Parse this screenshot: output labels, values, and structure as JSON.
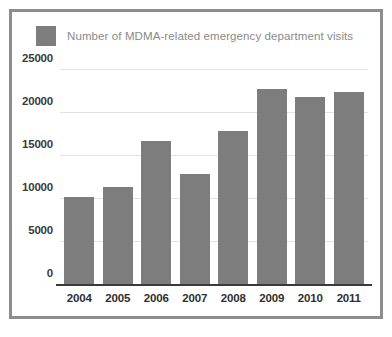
{
  "figure": {
    "border_color": "#8d8d8d",
    "background": "#ffffff"
  },
  "legend": {
    "swatch_icon": "legend-swatch-icon",
    "swatch_color": "#7d7d7d",
    "label": "Number of MDMA-related emergency department visits"
  },
  "chart_data": {
    "type": "bar",
    "title": "",
    "xlabel": "",
    "ylabel": "",
    "categories": [
      "2004",
      "2005",
      "2006",
      "2007",
      "2008",
      "2009",
      "2010",
      "2011"
    ],
    "values": [
      10200,
      11400,
      16700,
      12900,
      17900,
      22800,
      21900,
      22500
    ],
    "series": [
      {
        "name": "Number of MDMA-related emergency department visits",
        "color": "#7d7d7d",
        "values": [
          10200,
          11400,
          16700,
          12900,
          17900,
          22800,
          21900,
          22500
        ]
      }
    ],
    "ylim": [
      0,
      25000
    ],
    "yticks": [
      0,
      5000,
      10000,
      15000,
      20000,
      25000
    ],
    "ytick_labels": [
      "0",
      "5000",
      "10000",
      "15000",
      "20000",
      "25000"
    ],
    "grid": true,
    "grid_color": "#e3e3e3",
    "legend_position": "top-left",
    "bar_color": "#7d7d7d",
    "axis_color": "#3a3a3a"
  }
}
